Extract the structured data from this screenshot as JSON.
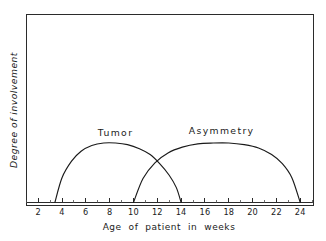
{
  "chart_data": {
    "type": "line",
    "title": "",
    "xlabel": "Age of patient in weeks",
    "ylabel": "Degree of involvement",
    "xlim": [
      0,
      26
    ],
    "ylim": [
      0,
      1
    ],
    "grid": false,
    "legend_position": "inline-above-curves",
    "x_tick_labels": [
      "2",
      "4",
      "6",
      "8",
      "10",
      "12",
      "14",
      "16",
      "18",
      "20",
      "22",
      "24"
    ],
    "x_tick_values": [
      2,
      4,
      6,
      8,
      10,
      12,
      14,
      16,
      18,
      20,
      22,
      24
    ],
    "x_minor_tick_values": [
      1,
      3,
      5,
      7,
      9,
      11,
      13,
      15,
      17,
      19,
      21,
      23,
      25
    ],
    "y_tick_labels": [],
    "series": [
      {
        "name": "Tumor",
        "label_x": 8.5,
        "label_y": 0.78,
        "x": [
          3.4,
          4.0,
          4.8,
          5.6,
          6.5,
          7.5,
          8.5,
          9.5,
          10.5,
          11.4,
          12.2,
          13.0,
          13.6,
          14.0
        ],
        "y": [
          0.0,
          0.3,
          0.5,
          0.62,
          0.69,
          0.72,
          0.72,
          0.7,
          0.65,
          0.58,
          0.47,
          0.33,
          0.18,
          0.0
        ]
      },
      {
        "name": "Asymmetry",
        "label_x": 17.4,
        "label_y": 0.8,
        "x": [
          10.0,
          10.8,
          11.8,
          12.9,
          14.1,
          15.4,
          16.7,
          18.0,
          19.3,
          20.5,
          21.6,
          22.5,
          23.3,
          24.0
        ],
        "y": [
          0.0,
          0.29,
          0.48,
          0.6,
          0.67,
          0.71,
          0.72,
          0.72,
          0.7,
          0.66,
          0.58,
          0.47,
          0.3,
          0.0
        ]
      }
    ]
  },
  "axes": {
    "x_title": "Age of patient in weeks",
    "y_title": "Degree of involvement"
  },
  "labels": {
    "tumor": "Tumor",
    "asymmetry": "Asymmetry"
  },
  "ticks": {
    "t2": "2",
    "t4": "4",
    "t6": "6",
    "t8": "8",
    "t10": "10",
    "t12": "12",
    "t14": "14",
    "t16": "16",
    "t18": "18",
    "t20": "20",
    "t22": "22",
    "t24": "24"
  },
  "colors": {
    "background": "#ffffff",
    "ink": "#1a1a1a",
    "frame": "#2b2b2b"
  }
}
